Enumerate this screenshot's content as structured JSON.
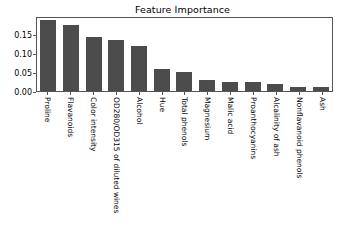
{
  "chart_data": {
    "type": "bar",
    "title": "Feature Importance",
    "xlabel": "",
    "ylabel": "",
    "ylim": [
      0,
      0.196
    ],
    "yticks": [
      "0.00",
      "0.05",
      "0.10",
      "0.15"
    ],
    "ytick_values": [
      0.0,
      0.05,
      0.1,
      0.15
    ],
    "grid": false,
    "legend": null,
    "bar_color": "#4c4c4c",
    "categories": [
      "Proline",
      "Flavanoids",
      "Color intensity",
      "OD280/OD315 of diluted wines",
      "Alcohol",
      "Hue",
      "Total phenols",
      "Magnesium",
      "Malic acid",
      "Proanthocyanins",
      "Alcalinity of ash",
      "Nonflavanoid phenols",
      "Ash"
    ],
    "values": [
      0.185,
      0.173,
      0.142,
      0.134,
      0.117,
      0.057,
      0.049,
      0.029,
      0.024,
      0.024,
      0.019,
      0.011,
      0.01
    ]
  }
}
